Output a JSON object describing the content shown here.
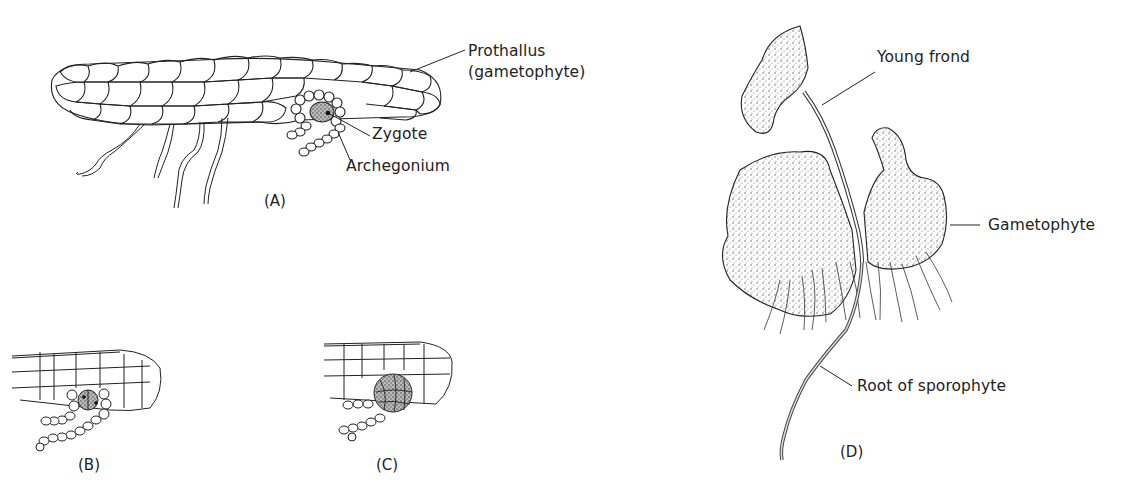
{
  "figure": {
    "panels": [
      {
        "id": "A",
        "label": "(A)"
      },
      {
        "id": "B",
        "label": "(B)"
      },
      {
        "id": "C",
        "label": "(C)"
      },
      {
        "id": "D",
        "label": "(D)"
      }
    ],
    "labels": {
      "prothallus_line1": "Prothallus",
      "prothallus_line2": "(gametophyte)",
      "zygote": "Zygote",
      "archegonium": "Archegonium",
      "young_frond": "Young frond",
      "gametophyte": "Gametophyte",
      "root_of_sporophyte": "Root of sporophyte"
    },
    "colors": {
      "ink": "#222222",
      "background": "#ffffff",
      "stipple": "#6a6a6a"
    }
  }
}
